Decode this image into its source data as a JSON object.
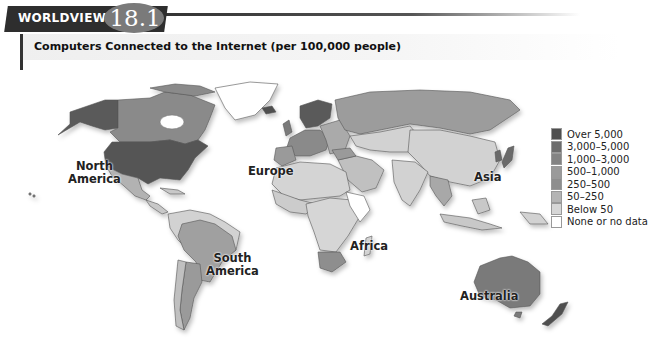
{
  "header": {
    "tab_label": "WORLDVIEW",
    "figure_number": "18.1",
    "subtitle": "Computers Connected to the Internet (per 100,000 people)"
  },
  "legend": {
    "items": [
      {
        "label": "Over 5,000",
        "color": "#4f4f4f"
      },
      {
        "label": "3,000–5,000",
        "color": "#6c6c6c"
      },
      {
        "label": "1,000–3,000",
        "color": "#838383"
      },
      {
        "label": "500–1,000",
        "color": "#9a9a9a"
      },
      {
        "label": "250–500",
        "color": "#8e8e8e"
      },
      {
        "label": "50–250",
        "color": "#b4b4b4"
      },
      {
        "label": "Below 50",
        "color": "#d6d6d6"
      },
      {
        "label": "None or no data",
        "color": "#ffffff"
      }
    ]
  },
  "map": {
    "labels": {
      "north_america_1": "North",
      "north_america_2": "America",
      "europe": "Europe",
      "asia": "Asia",
      "south_america_1": "South",
      "south_america_2": "America",
      "africa": "Africa",
      "australia": "Australia"
    }
  }
}
